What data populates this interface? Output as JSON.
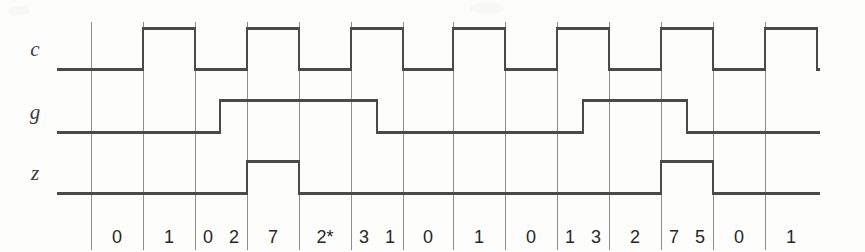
{
  "diagram": {
    "type": "digital-timing-diagram",
    "width": 865,
    "height": 252,
    "background_color": "#fdfdfc",
    "line_color": "#4a4a4a",
    "grid_color": "#8d8d8d",
    "text_color": "#272727",
    "signals": [
      {
        "name": "c",
        "label": "c",
        "baseline_y": 69,
        "high_y": 28,
        "start_x": 57,
        "end_x": 820,
        "high_intervals": [
          [
            143,
            195
          ],
          [
            247,
            299
          ],
          [
            351,
            403
          ],
          [
            453,
            505
          ],
          [
            557,
            609
          ],
          [
            661,
            713
          ],
          [
            765,
            817
          ]
        ]
      },
      {
        "name": "g",
        "label": "g",
        "baseline_y": 132,
        "high_y": 100,
        "start_x": 57,
        "end_x": 820,
        "high_intervals": [
          [
            220,
            377
          ],
          [
            583,
            687
          ]
        ]
      },
      {
        "name": "z",
        "label": "z",
        "baseline_y": 193,
        "high_y": 161,
        "start_x": 57,
        "end_x": 820,
        "high_intervals": [
          [
            247,
            299
          ],
          [
            661,
            713
          ]
        ]
      }
    ],
    "gridlines": {
      "x_positions": [
        91,
        143,
        195,
        247,
        299,
        351,
        403,
        453,
        505,
        557,
        609,
        661,
        713,
        765
      ],
      "top_y": 22,
      "bottom_y": 250
    },
    "state_row": {
      "y": 228,
      "cells": [
        {
          "x_start": 91,
          "x_end": 143,
          "values": [
            "0"
          ]
        },
        {
          "x_start": 143,
          "x_end": 195,
          "values": [
            "1"
          ]
        },
        {
          "x_start": 195,
          "x_end": 247,
          "values": [
            "0",
            "2"
          ]
        },
        {
          "x_start": 247,
          "x_end": 299,
          "values": [
            "7"
          ]
        },
        {
          "x_start": 299,
          "x_end": 351,
          "values": [
            "2*"
          ]
        },
        {
          "x_start": 351,
          "x_end": 403,
          "values": [
            "3",
            "1"
          ]
        },
        {
          "x_start": 403,
          "x_end": 453,
          "values": [
            "0"
          ]
        },
        {
          "x_start": 453,
          "x_end": 505,
          "values": [
            "1"
          ]
        },
        {
          "x_start": 505,
          "x_end": 557,
          "values": [
            "0"
          ]
        },
        {
          "x_start": 557,
          "x_end": 609,
          "values": [
            "1",
            "3"
          ]
        },
        {
          "x_start": 609,
          "x_end": 661,
          "values": [
            "2"
          ]
        },
        {
          "x_start": 661,
          "x_end": 713,
          "values": [
            "7",
            "5"
          ]
        },
        {
          "x_start": 713,
          "x_end": 765,
          "values": [
            "0"
          ]
        },
        {
          "x_start": 765,
          "x_end": 817,
          "values": [
            "1"
          ]
        }
      ],
      "sequence": [
        "0",
        "1",
        "0",
        "2",
        "7",
        "2*",
        "3",
        "1",
        "0",
        "1",
        "0",
        "1",
        "3",
        "2",
        "7",
        "5",
        "0",
        "1"
      ]
    }
  }
}
